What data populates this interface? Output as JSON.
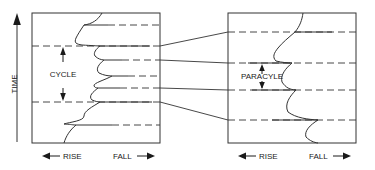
{
  "figure": {
    "type": "stratigraphic-cycle-diagram",
    "background_color": "#ffffff",
    "line_color": "#333333",
    "text_color": "#1a1a1a"
  },
  "axis": {
    "time_label": "TIME",
    "rise_label": "RISE",
    "fall_label": "FALL",
    "left_arrow_glyph": "◀",
    "right_arrow_glyph": "▶",
    "up_arrow_glyph": "▲"
  },
  "panels": [
    {
      "id": "left-panel",
      "name": "cycle-panel",
      "measure_label": "CYCLE",
      "box": {
        "x": 32,
        "y": 13,
        "width": 128,
        "height": 130
      },
      "rise_label": "RISE",
      "fall_label": "FALL",
      "bounding_dashed_levels": [
        46,
        102
      ],
      "interior_levels": [
        25,
        60,
        76,
        88,
        125
      ]
    },
    {
      "id": "right-panel",
      "name": "paracycle-panel",
      "measure_label": "PARACYLE",
      "box": {
        "x": 228,
        "y": 13,
        "width": 128,
        "height": 130
      },
      "rise_label": "RISE",
      "fall_label": "FALL",
      "bounding_dashed_levels": [
        63,
        90
      ],
      "interior_levels": [
        32,
        120
      ]
    }
  ],
  "connectors": {
    "count": 4,
    "description": "tie-lines linking left panel levels to right panel levels",
    "pairs": [
      {
        "from_y": 46,
        "to_y": 32
      },
      {
        "from_y": 60,
        "to_y": 63
      },
      {
        "from_y": 88,
        "to_y": 90
      },
      {
        "from_y": 102,
        "to_y": 120
      }
    ]
  }
}
